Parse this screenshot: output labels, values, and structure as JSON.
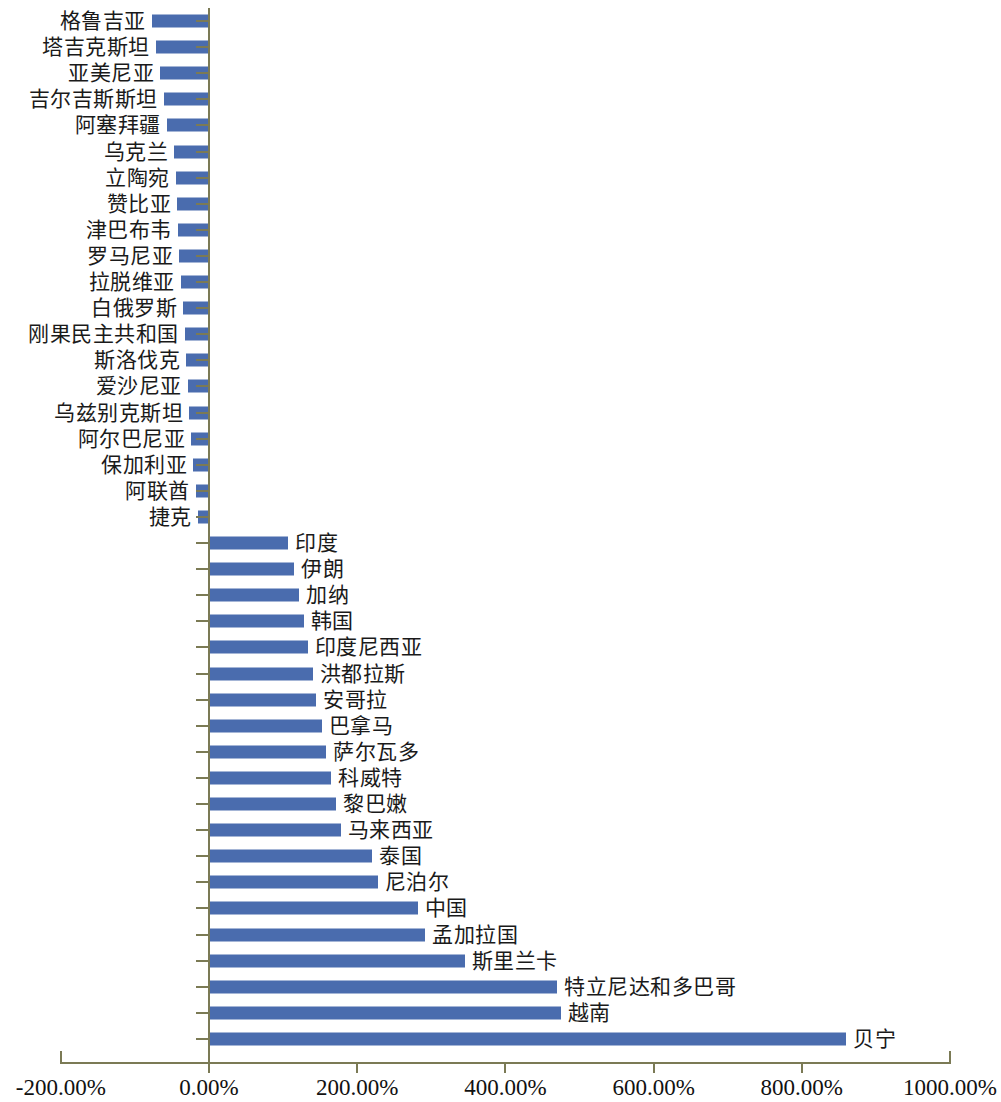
{
  "chart_data": {
    "type": "bar",
    "orientation": "horizontal",
    "title": "",
    "subtitle": "",
    "xlabel": "",
    "ylabel": "",
    "xlim": [
      -200,
      1000
    ],
    "xticks": [
      -200,
      0,
      200,
      400,
      600,
      800,
      1000
    ],
    "xtick_labels": [
      "-200.00%",
      "0.00%",
      "200.00%",
      "400.00%",
      "600.00%",
      "800.00%",
      "1000.00%"
    ],
    "grid": false,
    "legend": null,
    "bar_color": "#4a6cae",
    "axis_color": "#7b7a55",
    "categories": [
      "格鲁吉亚",
      "塔吉克斯坦",
      "亚美尼亚",
      "吉尔吉斯斯坦",
      "阿塞拜疆",
      "乌克兰",
      "立陶宛",
      "赞比亚",
      "津巴布韦",
      "罗马尼亚",
      "拉脱维亚",
      "白俄罗斯",
      "刚果民主共和国",
      "斯洛伐克",
      "爱沙尼亚",
      "乌兹别克斯坦",
      "阿尔巴尼亚",
      "保加利亚",
      "阿联酋",
      "捷克",
      "印度",
      "伊朗",
      "加纳",
      "韩国",
      "印度尼西亚",
      "洪都拉斯",
      "安哥拉",
      "巴拿马",
      "萨尔瓦多",
      "科威特",
      "黎巴嫩",
      "马来西亚",
      "泰国",
      "尼泊尔",
      "中国",
      "孟加拉国",
      "斯里兰卡",
      "特立尼达和多巴哥",
      "越南",
      "贝宁"
    ],
    "values": [
      -77,
      -72,
      -66,
      -61,
      -57,
      -47,
      -45,
      -43,
      -42,
      -40,
      -38,
      -35,
      -33,
      -31,
      -29,
      -27,
      -24,
      -21,
      -18,
      -15,
      107,
      115,
      122,
      128,
      133,
      140,
      145,
      152,
      158,
      165,
      172,
      178,
      220,
      228,
      282,
      292,
      345,
      470,
      475,
      860
    ],
    "value_unit": "%"
  }
}
